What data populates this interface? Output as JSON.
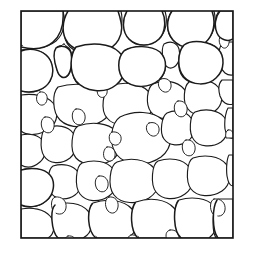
{
  "figure": {
    "kind": "line-drawing",
    "background_color": "#ffffff",
    "line_color": "#1b1b1b",
    "frame_color": "#141414",
    "cell_fill_color": "#ffffff",
    "canvas": {
      "width": 254,
      "height": 253
    },
    "frame": {
      "x": 21,
      "y": 11,
      "width": 212,
      "height": 227,
      "stroke_width": 1.6
    },
    "cell_count": 61,
    "labels": [],
    "caption": "",
    "axis_text": [],
    "legend": []
  },
  "chart_data": {
    "type": "diagram",
    "title": "",
    "xlabel": "",
    "ylabel": "",
    "grid": false,
    "legend": [],
    "cells": [
      {
        "id": "c01",
        "d": "M 21 11 L 63 11 C 66 22 64 34 56 41 C 46 49 30 50 21 45 Z"
      },
      {
        "id": "c02",
        "d": "M 69 11 C 86 11 104 11 121 11 C 124 24 120 39 110 47 C 98 56 80 56 70 47 C 62 39 62 22 69 11 Z"
      },
      {
        "id": "c03",
        "d": "M 128 11 C 141 11 153 11 165 11 C 168 21 166 32 159 39 C 150 47 136 47 129 39 C 123 31 123 19 128 11 Z"
      },
      {
        "id": "c04",
        "d": "M 172 11 C 187 11 201 11 214 11 C 217 22 214 35 205 42 C 194 50 179 48 172 39 C 166 31 166 19 172 11 Z"
      },
      {
        "id": "c05",
        "d": "M 219 11 L 233 11 L 233 38 C 227 41 220 38 217 32 C 214 25 215 16 219 11 Z"
      },
      {
        "id": "c06",
        "d": "M 21 50 C 30 48 41 50 47 56 C 53 62 54 73 50 81 C 45 90 33 94 21 91 Z"
      },
      {
        "id": "c07",
        "d": "M 57 47 C 63 44 69 46 71 52 C 73 58 72 66 70 72 C 68 78 62 79 59 74 C 55 67 54 55 57 47 Z"
      },
      {
        "id": "c08",
        "d": "M 76 46 C 92 42 110 44 119 53 C 127 61 126 75 118 83 C 108 92 89 93 79 85 C 70 78 69 55 76 46 Z"
      },
      {
        "id": "c09",
        "d": "M 125 50 C 137 45 152 46 160 53 C 168 61 167 73 159 80 C 149 88 132 88 124 80 C 117 72 118 56 125 50 Z"
      },
      {
        "id": "c10",
        "d": "M 164 44 C 171 40 177 43 179 49 C 181 56 179 64 174 67 C 169 70 164 66 163 59 C 162 53 162 47 164 44 Z"
      },
      {
        "id": "c11",
        "d": "M 185 44 C 197 40 211 42 218 49 C 225 57 224 70 216 77 C 206 85 190 85 183 77 C 176 69 178 50 185 44 Z"
      },
      {
        "id": "c12",
        "d": "M 223 42 L 233 42 L 233 75 C 227 76 222 72 220 65 C 218 56 219 47 223 42 Z"
      },
      {
        "id": "c13",
        "d": "M 21 95 C 34 93 47 96 53 103 C 59 110 58 122 50 128 C 40 136 27 136 21 131 Z"
      },
      {
        "id": "c14",
        "d": "M 58 87 C 74 82 94 84 105 92 C 115 100 113 114 102 121 C 89 129 69 129 60 120 C 52 112 52 93 58 87 Z"
      },
      {
        "id": "c15",
        "d": "M 110 86 C 124 81 140 83 148 91 C 156 99 154 113 144 120 C 132 127 114 127 107 118 C 100 110 103 91 110 86 Z"
      },
      {
        "id": "c16",
        "d": "M 153 84 C 164 79 177 81 184 89 C 191 96 190 108 181 114 C 171 121 157 120 151 112 C 145 104 147 88 153 84 Z"
      },
      {
        "id": "c17",
        "d": "M 189 82 C 200 78 212 80 218 87 C 224 94 223 105 215 111 C 206 117 193 116 188 109 C 182 102 184 86 189 82 Z"
      },
      {
        "id": "c18",
        "d": "M 222 80 L 233 80 L 233 104 C 227 106 222 102 220 96 C 218 89 219 83 222 80 Z"
      },
      {
        "id": "c19",
        "d": "M 21 135 C 30 133 39 135 43 141 C 47 147 46 157 40 162 C 33 168 26 168 21 165 Z"
      },
      {
        "id": "c20",
        "d": "M 46 128 C 57 124 68 126 73 133 C 78 140 77 152 70 158 C 61 165 49 164 44 156 C 39 148 41 131 46 128 Z"
      },
      {
        "id": "c21",
        "d": "M 78 126 C 92 121 108 123 116 131 C 124 139 122 153 112 160 C 100 167 83 166 76 158 C 69 150 72 130 78 126 Z"
      },
      {
        "id": "c22",
        "d": "M 120 117 C 134 110 153 111 163 120 C 174 130 173 148 161 157 C 147 167 126 166 117 155 C 108 144 111 123 120 117 Z"
      },
      {
        "id": "c23",
        "d": "M 167 113 C 176 109 186 111 191 118 C 196 125 195 136 188 141 C 180 147 169 146 164 139 C 159 132 162 116 167 113 Z"
      },
      {
        "id": "c24",
        "d": "M 195 112 C 206 108 218 110 224 117 C 230 124 229 136 221 142 C 212 148 199 147 194 140 C 188 133 190 115 195 112 Z"
      },
      {
        "id": "c25",
        "d": "M 228 108 L 233 108 L 233 138 C 229 139 226 135 225 129 C 224 120 226 111 228 108 Z"
      },
      {
        "id": "c26",
        "d": "M 21 170 C 31 167 43 169 49 176 C 55 183 54 195 46 201 C 37 208 27 208 21 205 Z"
      },
      {
        "id": "c27",
        "d": "M 53 166 C 63 163 73 165 78 172 C 83 179 82 190 75 195 C 67 201 56 200 51 193 C 46 186 48 169 53 166 Z"
      },
      {
        "id": "c28",
        "d": "M 82 163 C 94 159 107 161 113 169 C 119 177 118 190 109 196 C 99 203 86 202 80 194 C 74 186 76 166 82 163 Z"
      },
      {
        "id": "c29",
        "d": "M 117 162 C 130 157 146 159 154 168 C 162 177 160 191 149 198 C 137 205 121 204 114 195 C 107 186 110 165 117 162 Z"
      },
      {
        "id": "c30",
        "d": "M 158 161 C 170 157 183 159 189 167 C 195 175 194 188 185 194 C 175 201 162 200 156 192 C 150 184 152 164 158 161 Z"
      },
      {
        "id": "c31",
        "d": "M 193 158 C 205 154 219 156 226 164 C 232 172 231 185 222 191 C 211 198 197 197 191 189 C 185 181 187 161 193 158 Z"
      },
      {
        "id": "c32",
        "d": "M 229 155 L 233 155 L 233 186 C 230 186 228 182 227 176 C 226 168 227 158 229 155 Z"
      },
      {
        "id": "c33",
        "d": "M 21 209 C 32 207 44 209 50 216 C 56 223 55 234 48 238 L 21 238 Z"
      },
      {
        "id": "c34",
        "d": "M 55 205 C 67 201 81 203 88 211 C 95 219 93 233 83 238 L 58 238 C 52 231 51 208 55 205 Z"
      },
      {
        "id": "c35",
        "d": "M 93 203 C 107 198 124 200 132 209 C 140 218 138 232 128 238 L 97 238 C 89 231 88 206 93 203 Z"
      },
      {
        "id": "c36",
        "d": "M 136 202 C 150 197 166 199 174 208 C 182 217 180 231 170 238 L 139 238 C 132 231 131 205 136 202 Z"
      },
      {
        "id": "c37",
        "d": "M 179 200 C 192 196 207 198 214 206 C 221 215 219 230 209 238 L 181 238 C 174 230 174 203 179 200 Z"
      },
      {
        "id": "c38",
        "d": "M 218 199 L 233 199 L 233 238 L 216 238 C 211 230 213 203 218 199 Z"
      },
      {
        "id": "j01",
        "d": "M 64 44 C 68 46 69 52 67 58 C 65 63 61 64 59 60 C 57 54 59 45 64 44 Z"
      },
      {
        "id": "j02",
        "d": "M 100 85 C 105 84 108 88 107 93 C 106 97 102 99 99 96 C 96 93 97 86 100 85 Z"
      },
      {
        "id": "j03",
        "d": "M 161 79 C 167 77 172 81 171 87 C 170 92 165 94 161 90 C 157 86 158 80 161 79 Z"
      },
      {
        "id": "j04",
        "d": "M 149 123 C 155 121 160 125 159 131 C 158 136 153 138 149 134 C 145 130 146 124 149 123 Z"
      },
      {
        "id": "j05",
        "d": "M 112 132 C 118 131 122 135 121 140 C 120 145 115 147 111 143 C 108 139 109 133 112 132 Z"
      },
      {
        "id": "j06",
        "d": "M 107 147 C 112 146 116 150 115 156 C 114 161 109 163 105 159 C 102 155 104 148 107 147 Z"
      },
      {
        "id": "j07",
        "d": "M 55 197 C 62 196 67 201 66 208 C 65 214 59 216 54 212 C 50 207 51 198 55 197 Z"
      },
      {
        "id": "j08",
        "d": "M 109 197 C 115 196 119 201 118 207 C 117 213 112 215 108 211 C 104 206 105 198 109 197 Z"
      },
      {
        "id": "j09",
        "d": "M 214 199 C 221 198 226 203 225 210 C 224 216 218 218 213 214 C 209 209 210 200 214 199 Z"
      },
      {
        "id": "j10",
        "d": "M 76 109 C 82 108 86 113 85 119 C 84 125 78 127 74 122 C 71 117 72 110 76 109 Z"
      },
      {
        "id": "j11",
        "d": "M 45 117 C 51 116 55 121 54 127 C 53 133 47 135 43 130 C 40 125 41 118 45 117 Z"
      },
      {
        "id": "j12",
        "d": "M 203 60 C 209 59 213 64 212 70 C 211 76 205 78 201 73 C 198 68 199 61 203 60 Z"
      },
      {
        "id": "j13",
        "d": "M 222 35 C 227 34 230 38 229 43 C 228 48 224 50 221 46 C 218 42 219 36 222 35 Z"
      },
      {
        "id": "j14",
        "d": "M 131 235 C 136 234 140 238 139 243 L 128 243 C 127 239 128 236 131 235 Z"
      },
      {
        "id": "j15",
        "d": "M 170 230 C 176 229 180 234 179 240 L 167 240 C 165 235 166 231 170 230 Z"
      },
      {
        "id": "j16",
        "d": "M 68 236 C 73 235 77 239 76 244 L 65 244 C 64 240 65 237 68 236 Z"
      },
      {
        "id": "j17",
        "d": "M 29 60 C 34 59 38 64 37 70 C 36 76 30 78 26 73 C 23 68 25 61 29 60 Z"
      },
      {
        "id": "j18",
        "d": "M 150 52 C 156 51 160 56 159 62 C 158 68 152 70 148 65 C 145 60 146 53 150 52 Z"
      },
      {
        "id": "j19",
        "d": "M 99 176 C 105 175 109 180 108 186 C 107 192 101 194 97 189 C 94 184 95 177 99 176 Z"
      },
      {
        "id": "j20",
        "d": "M 186 140 C 192 139 196 144 195 150 C 194 156 188 158 184 153 C 181 148 182 141 186 140 Z"
      },
      {
        "id": "j21",
        "d": "M 228 130 C 232 129 234 133 233 138 L 226 138 C 225 134 226 131 228 130 Z"
      },
      {
        "id": "j22",
        "d": "M 40 92 C 45 91 48 95 47 100 C 46 105 41 107 38 103 C 35 99 37 93 40 92 Z"
      },
      {
        "id": "j23",
        "d": "M 178 101 C 184 100 188 105 187 111 C 186 117 180 119 176 114 C 173 109 174 102 178 101 Z"
      },
      {
        "id": "j24",
        "d": "M 120 58 C 126 57 130 62 129 68 C 128 74 122 76 118 71 C 115 66 116 59 120 58 Z"
      }
    ],
    "edges": [
      {
        "id": "e-top-01",
        "d": "M 63 11 C 64 24 61 35 53 42 C 45 49 33 50 21 47"
      },
      {
        "id": "e-top-02",
        "d": "M 68 11 C 62 21 61 34 68 43 C 76 52 91 55 104 51 C 117 47 124 35 121 22 C 120 17 119 14 118 11"
      },
      {
        "id": "e-top-03",
        "d": "M 127 11 C 122 20 122 32 129 39 C 137 47 151 47 159 39 C 166 32 166 19 162 11"
      },
      {
        "id": "e-top-04",
        "d": "M 172 11 C 166 20 166 32 173 40 C 181 49 196 50 205 43 C 214 35 216 22 212 11"
      },
      {
        "id": "e-top-05",
        "d": "M 220 11 C 215 17 214 26 217 33 C 220 40 228 42 233 39"
      },
      {
        "id": "e-mid-01",
        "d": "M 21 91 C 33 94 45 90 50 81 C 55 73 53 61 46 55 C 39 49 29 48 21 51"
      },
      {
        "id": "e-mid-02",
        "d": "M 56 48 C 62 44 69 47 71 53 C 73 61 71 71 68 75 C 64 80 59 77 57 70 C 54 61 53 52 56 48"
      },
      {
        "id": "e-mid-03",
        "d": "M 76 47 C 70 55 69 71 76 81 C 85 92 105 94 116 85 C 127 76 128 60 119 52 C 110 43 91 42 76 47"
      },
      {
        "id": "e-mid-04",
        "d": "M 124 51 C 117 58 117 72 124 80 C 133 89 150 88 159 80 C 167 72 168 60 160 52 C 151 45 133 45 124 51"
      },
      {
        "id": "e-mid-05",
        "d": "M 184 45 C 177 53 177 69 184 77 C 192 86 208 86 216 78 C 225 70 225 56 218 49 C 210 41 192 39 184 45"
      },
      {
        "id": "e-bot-01",
        "d": "M 21 205 C 29 208 39 207 46 201 C 54 195 56 182 50 175 C 44 168 31 167 21 170"
      },
      {
        "id": "e-bot-02",
        "d": "M 55 205 C 50 210 51 231 58 238"
      },
      {
        "id": "e-bot-03",
        "d": "M 92 204 C 87 211 87 231 96 238"
      },
      {
        "id": "e-bot-04",
        "d": "M 135 203 C 130 211 130 231 138 238"
      },
      {
        "id": "e-bot-05",
        "d": "M 178 201 C 173 209 173 231 181 238"
      },
      {
        "id": "e-bot-06",
        "d": "M 217 200 C 212 208 212 231 218 238"
      }
    ]
  }
}
